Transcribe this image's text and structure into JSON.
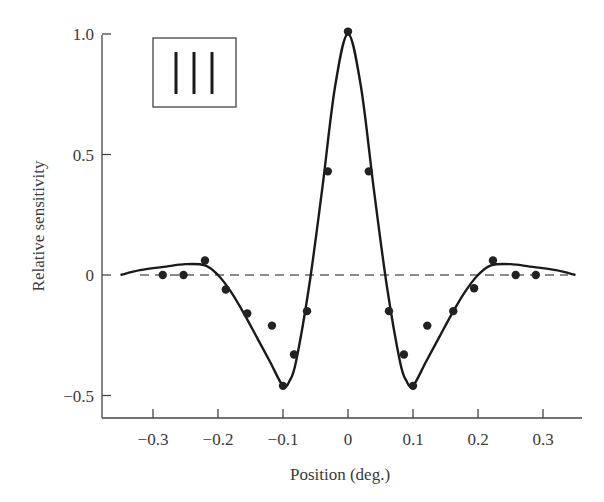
{
  "chart_data": {
    "type": "line",
    "title": "",
    "xlabel": "Position (deg.)",
    "ylabel": "Relative sensitivity",
    "xlim": [
      -0.37,
      0.36
    ],
    "ylim": [
      -0.6,
      1.0
    ],
    "grid": false,
    "legend": {
      "position": "upper-left",
      "entries": [
        "stimulus icon: three vertical bars"
      ]
    },
    "x_ticks": [
      -0.3,
      -0.2,
      -0.1,
      0,
      0.1,
      0.2,
      0.3
    ],
    "x_tick_labels": [
      "−0.3",
      "−0.2",
      "−0.1",
      "0",
      "0.1",
      "0.2",
      "0.3"
    ],
    "y_ticks": [
      1.0,
      0.5,
      0,
      -0.5
    ],
    "y_tick_labels": [
      "1.0",
      "0.5",
      "0",
      "−0.5"
    ],
    "reference_line": {
      "y": 0,
      "style": "dashed",
      "x_range": [
        -0.32,
        0.32
      ]
    },
    "series": [
      {
        "name": "measured",
        "kind": "scatter",
        "x": [
          -0.285,
          -0.253,
          -0.22,
          -0.188,
          -0.155,
          -0.117,
          -0.1,
          -0.083,
          -0.063,
          -0.031,
          0.0,
          0.032,
          0.063,
          0.086,
          0.1,
          0.122,
          0.162,
          0.194,
          0.223,
          0.258,
          0.289
        ],
        "y": [
          0.0,
          0.0,
          0.06,
          -0.06,
          -0.16,
          -0.21,
          -0.46,
          -0.33,
          -0.15,
          0.43,
          1.01,
          0.43,
          -0.15,
          -0.33,
          -0.46,
          -0.21,
          -0.15,
          -0.055,
          0.06,
          0.0,
          0.0
        ]
      },
      {
        "name": "model fit",
        "kind": "line",
        "x": [
          -0.35,
          -0.32,
          -0.28,
          -0.25,
          -0.22,
          -0.2,
          -0.18,
          -0.16,
          -0.14,
          -0.12,
          -0.1,
          -0.09,
          -0.08,
          -0.06,
          -0.04,
          -0.02,
          0.0,
          0.02,
          0.04,
          0.06,
          0.08,
          0.09,
          0.1,
          0.12,
          0.14,
          0.16,
          0.18,
          0.2,
          0.22,
          0.25,
          0.28,
          0.32,
          0.35
        ],
        "y": [
          0.0,
          0.02,
          0.035,
          0.045,
          0.04,
          0.0,
          -0.07,
          -0.16,
          -0.26,
          -0.36,
          -0.46,
          -0.44,
          -0.36,
          -0.05,
          0.35,
          0.78,
          1.0,
          0.78,
          0.35,
          -0.05,
          -0.36,
          -0.44,
          -0.46,
          -0.36,
          -0.26,
          -0.16,
          -0.07,
          0.0,
          0.04,
          0.045,
          0.035,
          0.02,
          0.0
        ]
      }
    ]
  },
  "colors": {
    "curve": "#1a1a1a",
    "points": "#222222",
    "axis": "#444444",
    "dash": "#666666"
  }
}
